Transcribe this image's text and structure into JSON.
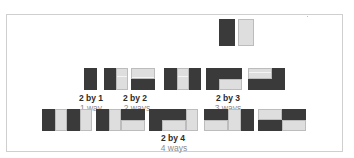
{
  "diagram": {
    "colors": {
      "dark": "#3a3a3a",
      "light": "#dedede",
      "frame": "#cfcfcf"
    },
    "top_example": {
      "tiles": [
        "dark vertical domino",
        "light vertical domino"
      ]
    },
    "groups": [
      {
        "label": "2 by 1",
        "count": "1 way",
        "tilings": 1
      },
      {
        "label": "2 by 2",
        "count": "2 ways",
        "tilings": 2
      },
      {
        "label": "2 by 3",
        "count": "3 ways",
        "tilings": 3
      },
      {
        "label": "2 by 4",
        "count": "4 ways",
        "tilings": 5
      }
    ]
  }
}
